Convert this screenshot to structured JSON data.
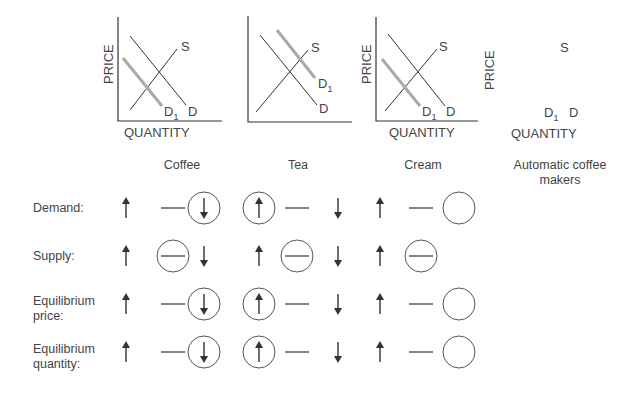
{
  "graphs": [
    {
      "id": "coffee",
      "y_axis_label": "PRICE",
      "x_axis_label": "QUANTITY",
      "curves": {
        "supply": "S",
        "demand": "D",
        "new_demand": "D",
        "new_demand_sub": "1"
      },
      "shift": "left"
    },
    {
      "id": "tea",
      "y_axis_label": "",
      "x_axis_label": "",
      "curves": {
        "supply": "S",
        "demand": "D",
        "new_demand": "D",
        "new_demand_sub": "1"
      },
      "shift": "right"
    },
    {
      "id": "cream",
      "y_axis_label": "PRICE",
      "x_axis_label": "QUANTITY",
      "curves": {
        "supply": "S",
        "demand": "D",
        "new_demand": "D",
        "new_demand_sub": "1"
      },
      "shift": "left"
    },
    {
      "id": "automatic-coffee-makers",
      "y_axis_label": "PRICE",
      "x_axis_label": "QUANTITY",
      "curves": {
        "supply": "S",
        "demand": "D",
        "new_demand": "D",
        "new_demand_sub": "1"
      },
      "shift": "unknown"
    }
  ],
  "columns": [
    "Coffee",
    "Tea",
    "Cream",
    "Automatic coffee makers"
  ],
  "rows": [
    {
      "label": "Demand:",
      "label_lines": [
        "Demand:"
      ],
      "options": [
        "up",
        "none",
        "down"
      ],
      "selected": {
        "coffee": "down",
        "tea": "up",
        "cream": "",
        "automatic": ""
      }
    },
    {
      "label": "Supply:",
      "label_lines": [
        "Supply:"
      ],
      "options": [
        "up",
        "none",
        "down"
      ],
      "selected": {
        "coffee": "none",
        "tea": "none",
        "cream": "none",
        "automatic": ""
      }
    },
    {
      "label": "Equilibrium price:",
      "label_lines": [
        "Equilibrium",
        "price:"
      ],
      "options": [
        "up",
        "none",
        "down"
      ],
      "selected": {
        "coffee": "down",
        "tea": "up",
        "cream": "",
        "automatic": ""
      }
    },
    {
      "label": "Equilibrium quantity:",
      "label_lines": [
        "Equilibrium",
        "quantity:"
      ],
      "options": [
        "up",
        "none",
        "down"
      ],
      "selected": {
        "coffee": "down",
        "tea": "up",
        "cream": "",
        "automatic": ""
      }
    }
  ],
  "colors": {
    "line": "#333333",
    "shifted_curve": "#a8a8a8",
    "text": "#444444",
    "circle": "#555555"
  }
}
